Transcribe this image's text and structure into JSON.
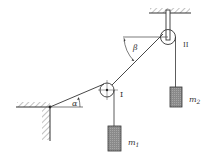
{
  "diagram": {
    "labels": {
      "angle_alpha": "α",
      "angle_beta": "β",
      "pulley_1": "I",
      "pulley_2": "II",
      "mass_1": "m",
      "mass_1_sub": "1",
      "mass_2": "m",
      "mass_2_sub": "2"
    },
    "colors": {
      "line": "#333333",
      "mass_fill": "#8a8a8a"
    }
  }
}
